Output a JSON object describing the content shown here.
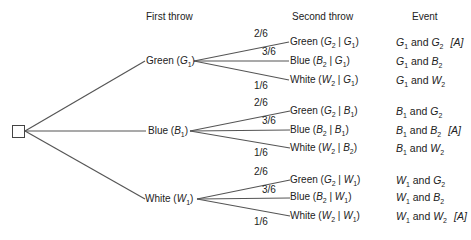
{
  "headers": {
    "first_throw": "First throw",
    "second_throw": "Second throw",
    "event": "Event"
  },
  "first_throw": [
    {
      "color": "Green",
      "sym": "G",
      "sub": "1"
    },
    {
      "color": "Blue",
      "sym": "B",
      "sub": "1"
    },
    {
      "color": "White",
      "sym": "W",
      "sub": "1"
    }
  ],
  "branches": [
    {
      "probs": [
        "2/6",
        "3/6",
        "1/6"
      ],
      "second": [
        {
          "color": "Green",
          "a": "G",
          "asub": "2",
          "b": "G",
          "bsub": "1"
        },
        {
          "color": "Blue",
          "a": "B",
          "asub": "2",
          "b": "G",
          "bsub": "1"
        },
        {
          "color": "White",
          "a": "W",
          "asub": "2",
          "b": "G",
          "bsub": "1"
        }
      ],
      "events": [
        {
          "x": "G",
          "xsub": "1",
          "conj": "and",
          "y": "G",
          "ysub": "2",
          "tag": "[A]"
        },
        {
          "x": "G",
          "xsub": "1",
          "conj": "and",
          "y": "B",
          "ysub": "2",
          "tag": ""
        },
        {
          "x": "G",
          "xsub": "1",
          "conj": "and",
          "y": "W",
          "ysub": "2",
          "tag": ""
        }
      ]
    },
    {
      "probs": [
        "2/6",
        "3/6",
        "1/6"
      ],
      "second": [
        {
          "color": "Green",
          "a": "G",
          "asub": "2",
          "b": "B",
          "bsub": "1"
        },
        {
          "color": "Blue",
          "a": "B",
          "asub": "2",
          "b": "B",
          "bsub": "1"
        },
        {
          "color": "White",
          "a": "W",
          "asub": "2",
          "b": "B",
          "bsub": "2"
        }
      ],
      "events": [
        {
          "x": "B",
          "xsub": "1",
          "conj": "and",
          "y": "G",
          "ysub": "2",
          "tag": ""
        },
        {
          "x": "B",
          "xsub": "1",
          "conj": "and",
          "y": "B",
          "ysub": "2",
          "tag": "[A]"
        },
        {
          "x": "B",
          "xsub": "1",
          "conj": "and",
          "y": "W",
          "ysub": "2",
          "tag": ""
        }
      ]
    },
    {
      "probs": [
        "2/6",
        "3/6",
        "1/6"
      ],
      "second": [
        {
          "color": "Green",
          "a": "G",
          "asub": "2",
          "b": "W",
          "bsub": "1"
        },
        {
          "color": "Blue",
          "a": "B",
          "asub": "2",
          "b": "W",
          "bsub": "1"
        },
        {
          "color": "White",
          "a": "W",
          "asub": "2",
          "b": "W",
          "bsub": "1"
        }
      ],
      "events": [
        {
          "x": "W",
          "xsub": "1",
          "conj": "and",
          "y": "G",
          "ysub": "2",
          "tag": ""
        },
        {
          "x": "W",
          "xsub": "1",
          "conj": "and",
          "y": "B",
          "ysub": "2",
          "tag": ""
        },
        {
          "x": "W",
          "xsub": "1",
          "conj": "and",
          "y": "W",
          "ysub": "2",
          "tag": "[A]"
        }
      ]
    }
  ]
}
